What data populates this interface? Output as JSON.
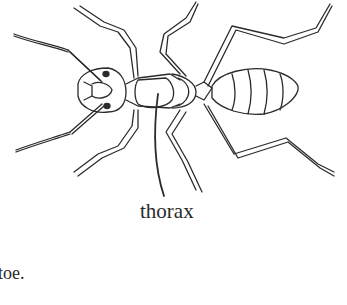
{
  "figure": {
    "labels": [
      {
        "text": "thorax",
        "points_to": "thorax"
      }
    ]
  },
  "caption": {
    "visible_text": "toe."
  },
  "colors": {
    "line": "#2b2b2b",
    "background": "#ffffff"
  }
}
